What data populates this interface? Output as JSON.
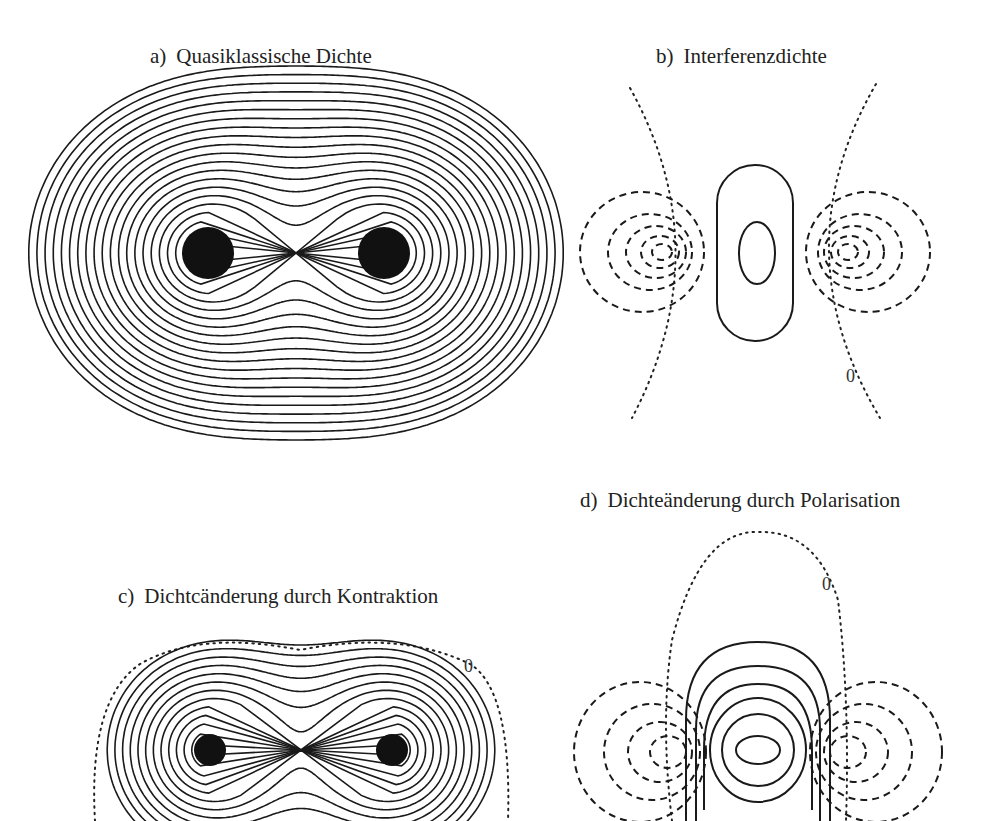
{
  "figure": {
    "panels": [
      {
        "id": "a",
        "label": "a)",
        "title": "Quasiklassische Dichte",
        "contour_styles": [
          "solid"
        ],
        "zero_label": null,
        "description": "Two-center electron density: nested solid contours around two nuclei, outer contours enclosing both"
      },
      {
        "id": "b",
        "label": "b)",
        "title": "Interferenzdichte",
        "contour_styles": [
          "solid",
          "dashed",
          "dotted"
        ],
        "zero_label": "0",
        "description": "Positive (solid) interference density in the bond region, negative (dashed) around nuclei, dotted zero contour"
      },
      {
        "id": "c",
        "label": "c)",
        "title": "Dichtcänderung durch Kontraktion",
        "contour_styles": [
          "solid",
          "dotted"
        ],
        "zero_label": "0",
        "description": "Density change due to contraction: solid contours around both nuclei, dotted zero contour enclosing all"
      },
      {
        "id": "d",
        "label": "d)",
        "title": "Dichteänderung durch Polarisation",
        "contour_styles": [
          "solid",
          "dashed",
          "dotted"
        ],
        "zero_label": "0",
        "description": "Density change due to polarization: solid contours in bond center, dashed lobes outside nuclei, dotted zero contour"
      }
    ],
    "legend": {
      "solid": "positive",
      "dashed": "negative",
      "dotted": "zero"
    },
    "colors": {
      "line": "#1a1a1a",
      "background": "#ffffff"
    }
  }
}
